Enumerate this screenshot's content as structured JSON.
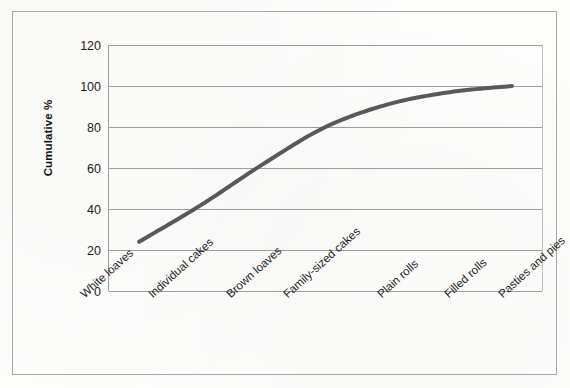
{
  "chart_data": {
    "type": "line",
    "title": "",
    "xlabel": "",
    "ylabel": "Cumulative %",
    "categories": [
      "White loaves",
      "Individual cakes",
      "Brown loaves",
      "Family-sized cakes",
      "Plain rolls",
      "Filled rolls",
      "Pasties and pies"
    ],
    "values": [
      24,
      42,
      62,
      80,
      91,
      97,
      100
    ],
    "series": [
      {
        "name": "Cumulative %",
        "values": [
          24,
          42,
          62,
          80,
          91,
          97,
          100
        ]
      }
    ],
    "ylim": [
      0,
      120
    ],
    "ytick_labels": [
      "120",
      "100",
      "80",
      "60",
      "40",
      "20",
      "0"
    ],
    "ytick_values": [
      120,
      100,
      80,
      60,
      40,
      20,
      0
    ],
    "ytick_step": 20,
    "grid": "horizontal",
    "legend": "none",
    "line_color": "#595959",
    "line_width_px": 4,
    "markers": "none",
    "frame_color": "#a6a6a6",
    "gridline_color": "#9d9d9d",
    "background_color": "#fdfdfc"
  }
}
